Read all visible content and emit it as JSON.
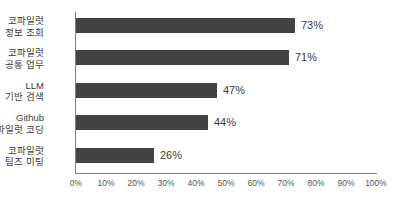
{
  "chart_data": {
    "type": "bar",
    "orientation": "horizontal",
    "title": "",
    "xlabel": "",
    "ylabel": "",
    "categories": [
      "코파일럿\n정보 조회",
      "코파일럿\n공통 업무",
      "LLM\n기반 검색",
      "Github\n코파일럿 코딩",
      "코파일럿\n팀즈 미팅"
    ],
    "category_lines": [
      [
        "코파일럿",
        "정보 조회"
      ],
      [
        "코파일럿",
        "공통 업무"
      ],
      [
        "LLM",
        "기반 검색"
      ],
      [
        "Github",
        "코파일럿 코딩"
      ],
      [
        "코파일럿",
        "팀즈 미팅"
      ]
    ],
    "values": [
      73,
      71,
      47,
      44,
      26
    ],
    "value_labels": [
      "73%",
      "71%",
      "47%",
      "44%",
      "26%"
    ],
    "xlim": [
      0,
      100
    ],
    "xticks": [
      0,
      10,
      20,
      30,
      40,
      50,
      60,
      70,
      80,
      90,
      100
    ],
    "xtick_labels": [
      "0%",
      "10%",
      "20%",
      "30%",
      "40%",
      "50%",
      "60%",
      "70%",
      "80%",
      "90%",
      "100%"
    ],
    "grid": false,
    "legend": false,
    "bar_color": "#434343",
    "axis_color": "#808080",
    "text_color": "#3c3c3c",
    "background": "#ffffff"
  }
}
